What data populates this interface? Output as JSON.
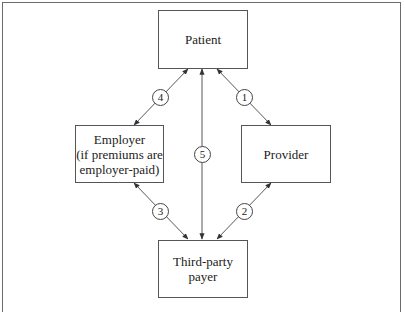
{
  "diagram": {
    "nodes": {
      "patient": {
        "label": "Patient"
      },
      "employer": {
        "lines": [
          "Employer",
          "(if premiums are",
          "employer-paid)"
        ]
      },
      "provider": {
        "label": "Provider"
      },
      "payer": {
        "lines": [
          "Third-party",
          "payer"
        ]
      }
    },
    "edges": [
      {
        "id": "1",
        "from": "patient",
        "to": "provider",
        "bidirectional": true
      },
      {
        "id": "2",
        "from": "provider",
        "to": "payer",
        "bidirectional": true
      },
      {
        "id": "3",
        "from": "employer",
        "to": "payer",
        "bidirectional": true
      },
      {
        "id": "4",
        "from": "patient",
        "to": "employer",
        "bidirectional": true
      },
      {
        "id": "5",
        "from": "patient",
        "to": "payer",
        "bidirectional": true
      }
    ],
    "badges": {
      "b1": "1",
      "b2": "2",
      "b3": "3",
      "b4": "4",
      "b5": "5"
    },
    "colors": {
      "stroke": "#444444",
      "background": "#ffffff"
    }
  }
}
